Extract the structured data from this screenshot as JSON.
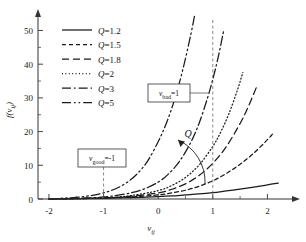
{
  "chart_data": {
    "type": "line",
    "title": "",
    "xlabel": "v_ij",
    "ylabel": "f(v_ij)",
    "xlim": [
      -2.2,
      2.45
    ],
    "ylim": [
      0,
      54
    ],
    "xticks": [
      -2,
      -1,
      0,
      1,
      2
    ],
    "xtick_labels": [
      "-2",
      "-1",
      "0",
      "1",
      "2"
    ],
    "yticks": [
      0,
      10,
      20,
      30,
      40,
      50
    ],
    "ytick_labels": [
      "0",
      "10",
      "20",
      "30",
      "40",
      "50"
    ],
    "grid": false,
    "legend_position": "top-left",
    "series": [
      {
        "name": "Q=1.2",
        "label": "Q=1.2",
        "q": 1.2,
        "dash": "none",
        "x": [
          -2.0,
          -1.5,
          -1.0,
          -0.5,
          0.0,
          0.25,
          0.5,
          0.75,
          1.0,
          1.25,
          1.5,
          1.75,
          2.0,
          2.2
        ],
        "y": [
          0.0,
          0.1,
          0.2,
          0.4,
          0.7,
          0.9,
          1.2,
          1.5,
          1.9,
          2.4,
          2.9,
          3.5,
          4.2,
          4.7
        ]
      },
      {
        "name": "Q=1.5",
        "label": "Q=1.5",
        "q": 1.5,
        "dash": "4,3",
        "x": [
          -2.0,
          -1.5,
          -1.0,
          -0.5,
          0.0,
          0.25,
          0.5,
          0.75,
          1.0,
          1.25,
          1.5,
          1.75,
          2.0,
          2.1
        ],
        "y": [
          0.0,
          0.1,
          0.3,
          0.6,
          1.2,
          1.8,
          2.6,
          3.8,
          5.4,
          7.6,
          10.3,
          13.6,
          17.6,
          19.4
        ]
      },
      {
        "name": "Q=1.8",
        "label": "Q=1.8",
        "q": 1.8,
        "dash": "7,4",
        "x": [
          -2.0,
          -1.5,
          -1.0,
          -0.5,
          0.0,
          0.25,
          0.5,
          0.75,
          1.0,
          1.25,
          1.5,
          1.65,
          1.8
        ],
        "y": [
          0.0,
          0.1,
          0.3,
          0.8,
          1.8,
          2.9,
          4.5,
          7.0,
          10.6,
          15.6,
          22.4,
          27.4,
          33.2
        ]
      },
      {
        "name": "Q=2",
        "label": "Q=2",
        "q": 2,
        "dash": "1,2.4",
        "x": [
          -2.0,
          -1.5,
          -1.0,
          -0.5,
          0.0,
          0.25,
          0.5,
          0.75,
          1.0,
          1.15,
          1.3,
          1.45,
          1.55
        ],
        "y": [
          0.0,
          0.1,
          0.3,
          1.0,
          2.5,
          4.0,
          6.4,
          10.1,
          15.6,
          20.0,
          25.5,
          32.3,
          37.5
        ]
      },
      {
        "name": "Q=3",
        "label": "Q=3",
        "q": 3,
        "dash": "9,3,1.6,3",
        "x": [
          -2.0,
          -1.5,
          -1.0,
          -0.6,
          -0.3,
          0.0,
          0.2,
          0.4,
          0.6,
          0.75,
          0.9,
          1.0,
          1.1,
          1.2
        ],
        "y": [
          0.0,
          0.2,
          0.6,
          1.5,
          2.7,
          5.0,
          7.6,
          11.4,
          16.9,
          22.5,
          29.8,
          35.5,
          42.2,
          50.0
        ]
      },
      {
        "name": "Q=5",
        "label": "Q=5",
        "q": 5,
        "dash": "9,3,1.6,3,1.6,3",
        "x": [
          -2.0,
          -1.5,
          -1.2,
          -1.0,
          -0.8,
          -0.6,
          -0.4,
          -0.2,
          0.0,
          0.15,
          0.3,
          0.45,
          0.6,
          0.7,
          0.8
        ],
        "y": [
          0.0,
          0.5,
          1.1,
          1.8,
          2.9,
          4.6,
          7.2,
          11.1,
          17.0,
          22.5,
          29.5,
          38.3,
          49.0,
          57.0,
          63.0
        ]
      }
    ],
    "annotations": [
      {
        "id": "v-good",
        "text_main": "v",
        "text_sub": "good",
        "text_eq": "=",
        "text_val": "-1",
        "at_x": -1.0,
        "box_x": 78,
        "box_y": 149,
        "box_w": 48,
        "box_h": 18
      },
      {
        "id": "v-bad",
        "text_main": "v",
        "text_sub": "bad",
        "text_eq": "=",
        "text_val": "1",
        "at_x": 1.0,
        "box_x": 148,
        "box_y": 84,
        "box_w": 42,
        "box_h": 18
      },
      {
        "id": "q-arrow",
        "text_main": "Q",
        "meaning": "direction of increasing Q"
      }
    ]
  },
  "legend": {
    "items": [
      {
        "label_q": "Q",
        "label_eq": "=1.2"
      },
      {
        "label_q": "Q",
        "label_eq": "=1.5"
      },
      {
        "label_q": "Q",
        "label_eq": "=1.8"
      },
      {
        "label_q": "Q",
        "label_eq": "=2"
      },
      {
        "label_q": "Q",
        "label_eq": "=3"
      },
      {
        "label_q": "Q",
        "label_eq": "=5"
      }
    ]
  },
  "axes": {
    "x_label_main": "v",
    "x_label_sub": "ij",
    "y_label_f": "f",
    "y_label_open": "(",
    "y_label_v": "v",
    "y_label_sub": "ij",
    "y_label_close": ")"
  },
  "colors": {
    "line": "#1a1a1a",
    "axis": "#333333",
    "background": "#ffffff",
    "dashed_guide": "#555555"
  }
}
